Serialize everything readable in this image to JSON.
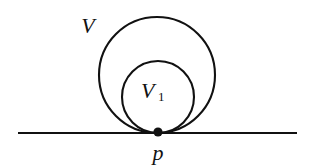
{
  "figure": {
    "background_color": "#ffffff",
    "stroke_color": "#111111",
    "width": 318,
    "height": 167,
    "labels": {
      "outer_circle": "V",
      "inner_circle": "V",
      "inner_circle_subscript": "1",
      "tangency_point": "p"
    },
    "elements": {
      "outer_circle": {
        "name": "V",
        "center_x": 157,
        "center_y": 75,
        "radius": 58,
        "stroke_width": 2.1
      },
      "inner_circle": {
        "name": "V1",
        "center_x": 158,
        "center_y": 97,
        "radius": 36,
        "stroke_width": 2.1
      },
      "tangent_line": {
        "name": "tangent-line",
        "x1": 18,
        "y1": 133,
        "x2": 297,
        "y2": 133,
        "stroke_width": 2.2
      },
      "tangency_dot": {
        "name": "p",
        "center_x": 158,
        "center_y": 132,
        "radius": 4.6
      }
    },
    "label_positions": {
      "outer_label_x": 88,
      "outer_label_y": 33,
      "inner_label_x": 141,
      "inner_label_y": 98,
      "inner_sub_x": 158,
      "inner_sub_y": 101,
      "point_label_x": 151,
      "point_label_y": 160
    }
  }
}
